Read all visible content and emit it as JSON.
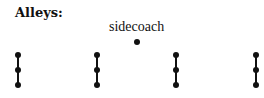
{
  "diagram": {
    "title": "Alleys:",
    "sidecoach": {
      "label": "sidecoach",
      "dot": {
        "x": 137,
        "y": 42
      }
    },
    "alleys": [
      {
        "x": 18,
        "dots_y": [
          55,
          70,
          85
        ]
      },
      {
        "x": 97,
        "dots_y": [
          55,
          70,
          85
        ]
      },
      {
        "x": 176,
        "dots_y": [
          55,
          70,
          85
        ]
      },
      {
        "x": 256,
        "dots_y": [
          55,
          70,
          85
        ]
      }
    ],
    "colors": {
      "ink": "#111111",
      "background": "#ffffff"
    }
  }
}
